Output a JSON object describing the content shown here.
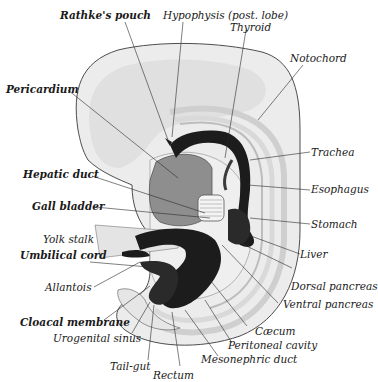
{
  "figure": {
    "colors": {
      "background": "#ffffff",
      "body_outer": "#ececec",
      "body_inner": "#dcdcdc",
      "pericardium": "#8e8e8e",
      "gut_dark": "#1c1c1c",
      "outline": "#3a3a3a",
      "label_text": "#1a1a1a"
    }
  },
  "labels": {
    "rathkes_pouch": "Rathke's pouch",
    "hypophysis": "Hypophysis (post. lobe)",
    "thyroid": "Thyroid",
    "notochord": "Notochord",
    "pericardium": "Pericardium",
    "trachea": "Trachea",
    "hepatic_duct": "Hepatic duct",
    "esophagus": "Esophagus",
    "gall_bladder": "Gall bladder",
    "stomach": "Stomach",
    "yolk_stalk": "Yolk stalk",
    "liver": "Liver",
    "umbilical_cord": "Umbilical cord",
    "dorsal_pancreas": "Dorsal pancreas",
    "allantois": "Allantois",
    "ventral_pancreas": "Ventral pancreas",
    "cloacal_membrane": "Cloacal membrane",
    "caecum": "Cæcum",
    "urogenital_sinus": "Urogenital sinus",
    "peritoneal_cavity": "Peritoneal cavity",
    "mesonephric_duct": "Mesonephric duct",
    "tail_gut": "Tail-gut",
    "rectum": "Rectum"
  }
}
